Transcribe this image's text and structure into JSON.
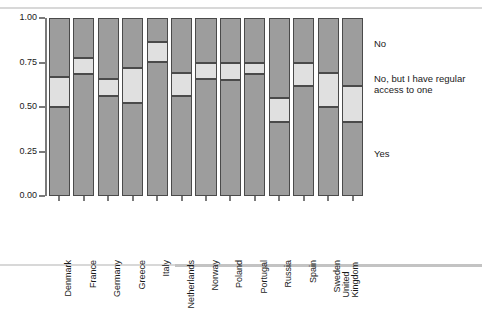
{
  "chart_data": {
    "type": "bar",
    "subtype": "stacked-percentage",
    "title": "",
    "xlabel": "",
    "ylabel": "",
    "ylim": [
      0.0,
      1.0
    ],
    "grid": false,
    "legend_position": "right",
    "categories": [
      "Denmark",
      "France",
      "Germany",
      "Greece",
      "Italy",
      "Netherlands",
      "Norway",
      "Poland",
      "Portugal",
      "Russia",
      "Spain",
      "Sweden",
      "United Kingdom"
    ],
    "ytick_labels": [
      "0.00",
      "0.25",
      "0.50",
      "0.75",
      "1.00"
    ],
    "ytick_values": [
      0.0,
      0.25,
      0.5,
      0.75,
      1.0
    ],
    "series": [
      {
        "name": "Yes",
        "color": "#9d9d9d",
        "values": [
          0.5,
          0.685,
          0.56,
          0.52,
          0.755,
          0.56,
          0.655,
          0.65,
          0.685,
          0.415,
          0.62,
          0.5,
          0.415
        ]
      },
      {
        "name": "No, but I have regular access to one",
        "color": "#e0e0e0",
        "values": [
          0.17,
          0.09,
          0.095,
          0.2,
          0.11,
          0.13,
          0.095,
          0.1,
          0.065,
          0.135,
          0.13,
          0.19,
          0.205
        ]
      },
      {
        "name": "No",
        "color": "#9d9d9d",
        "values": [
          0.33,
          0.225,
          0.345,
          0.28,
          0.135,
          0.31,
          0.25,
          0.25,
          0.25,
          0.45,
          0.25,
          0.31,
          0.38
        ]
      }
    ],
    "cumulative_tops": {
      "yes": [
        0.5,
        0.685,
        0.56,
        0.52,
        0.755,
        0.56,
        0.655,
        0.65,
        0.685,
        0.415,
        0.62,
        0.5,
        0.415
      ],
      "middle": [
        0.67,
        0.775,
        0.655,
        0.72,
        0.865,
        0.69,
        0.75,
        0.75,
        0.75,
        0.55,
        0.75,
        0.69,
        0.62
      ]
    }
  },
  "legend": {
    "entries": [
      {
        "label": "No"
      },
      {
        "label": "No, but I have regular\naccess to one"
      },
      {
        "label": "Yes"
      }
    ]
  }
}
